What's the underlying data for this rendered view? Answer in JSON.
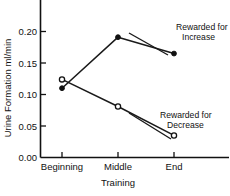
{
  "chart_data": {
    "type": "line",
    "title": "",
    "xlabel": "Training",
    "ylabel": "Urine Formation ml/min",
    "categories": [
      "Beginning",
      "Middle",
      "End"
    ],
    "xtick_labels": [
      "Beginning",
      "Middle",
      "End"
    ],
    "ytick_labels": [
      "0.00",
      "0.05",
      "0.10",
      "0.15",
      "0.20"
    ],
    "ytick_values": [
      0.0,
      0.05,
      0.1,
      0.15,
      0.2
    ],
    "ylim": [
      0.0,
      0.225
    ],
    "grid": false,
    "legend_position": "inline-annotations",
    "series": [
      {
        "name": "Rewarded for Increase",
        "marker": "filled-circle",
        "values": [
          0.11,
          0.191,
          0.165
        ]
      },
      {
        "name": "Rewarded for Decrease",
        "marker": "open-circle",
        "values": [
          0.124,
          0.081,
          0.035
        ]
      }
    ],
    "annotations": [
      {
        "text_line1": "Rewarded for",
        "text_line2": "Increase",
        "points_to": "Middle/End increase segment"
      },
      {
        "text_line1": "Rewarded for",
        "text_line2": "Decrease",
        "points_to": "End decrease point"
      }
    ]
  },
  "axis": {
    "y_title": "Urine Formation ml/min",
    "x_title": "Training",
    "y_labels": [
      "0.20",
      "0.15",
      "0.10",
      "0.05",
      "0.00"
    ],
    "x_labels": [
      "Beginning",
      "Middle",
      "End"
    ]
  },
  "annotations": {
    "increase": {
      "line1": "Rewarded for",
      "line2": "Increase"
    },
    "decrease": {
      "line1": "Rewarded for",
      "line2": "Decrease"
    }
  },
  "colors": {
    "ink": "#111111",
    "background": "#ffffff"
  }
}
